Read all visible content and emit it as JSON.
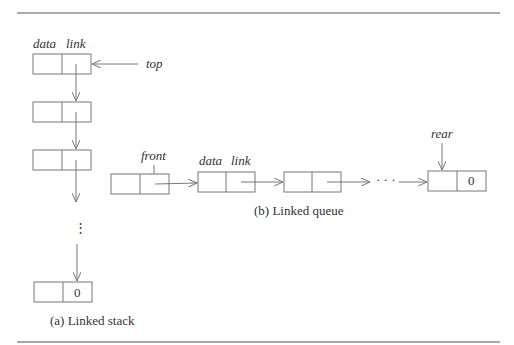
{
  "stack": {
    "header_data": "data",
    "header_link": "link",
    "top_label": "top",
    "null_value": "0",
    "ellipsis": "⋮",
    "caption": "(a) Linked stack"
  },
  "queue": {
    "front_label": "front",
    "header_data": "data",
    "header_link": "link",
    "rear_label": "rear",
    "null_value": "0",
    "ellipsis": "· · ·",
    "caption": "(b) Linked queue"
  }
}
